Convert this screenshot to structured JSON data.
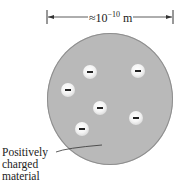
{
  "diagram": {
    "dimension": {
      "prefix": "≈10",
      "exponent": "−10",
      "unit": " m"
    },
    "sphere": {
      "fill": "#b9b9b9",
      "edge": "#8e8e8e"
    },
    "electrons": [
      {
        "symbol": "−",
        "x": 90,
        "y": 72
      },
      {
        "symbol": "−",
        "x": 138,
        "y": 71
      },
      {
        "symbol": "−",
        "x": 68,
        "y": 90
      },
      {
        "symbol": "−",
        "x": 100,
        "y": 108
      },
      {
        "symbol": "−",
        "x": 136,
        "y": 118
      },
      {
        "symbol": "−",
        "x": 82,
        "y": 129
      }
    ],
    "label": {
      "lines": [
        "Positively",
        "charged",
        "material"
      ]
    }
  }
}
